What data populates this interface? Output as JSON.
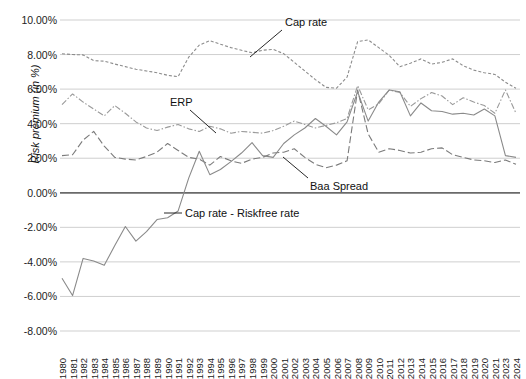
{
  "chart_data": {
    "type": "line",
    "title": "",
    "xlabel": "",
    "ylabel": "Risk premium (in %)",
    "ylim": [
      -8,
      10
    ],
    "ytick_labels": [
      "10.00%",
      "8.00%",
      "6.00%",
      "4.00%",
      "2.00%",
      "0.00%",
      "-2.00%",
      "-4.00%",
      "-6.00%",
      "-8.00%"
    ],
    "ytick_values": [
      10,
      8,
      6,
      4,
      2,
      0,
      -2,
      -4,
      -6,
      -8
    ],
    "grid": true,
    "zero_line": true,
    "legend_position": "inline-annotations",
    "categories": [
      "1980",
      "1981",
      "1982",
      "1983",
      "1984",
      "1985",
      "1986",
      "1987",
      "1988",
      "1989",
      "1990",
      "1991",
      "1992",
      "1993",
      "1994",
      "1995",
      "1996",
      "1997",
      "1998",
      "1999",
      "2000",
      "2001",
      "2002",
      "2003",
      "2004",
      "2005",
      "2006",
      "2007",
      "2008",
      "2009",
      "2010",
      "2011",
      "2012",
      "2013",
      "2014",
      "2015",
      "2016",
      "2017",
      "2018",
      "2019",
      "2020",
      "2021",
      "2023",
      "2024"
    ],
    "series": [
      {
        "name": "Cap rate",
        "style": "short-dash",
        "color": "#8c8c8c",
        "values": [
          8.05,
          8.0,
          7.98,
          7.65,
          7.62,
          7.45,
          7.3,
          7.15,
          7.05,
          6.95,
          6.8,
          6.72,
          7.85,
          8.55,
          8.8,
          8.6,
          8.4,
          8.25,
          8.1,
          8.25,
          8.3,
          8.05,
          7.55,
          7.05,
          6.55,
          6.1,
          6.05,
          6.7,
          8.75,
          8.85,
          8.4,
          7.95,
          7.3,
          7.5,
          7.75,
          7.45,
          7.55,
          7.75,
          7.35,
          7.1,
          6.95,
          6.85,
          6.4,
          6.05
        ]
      },
      {
        "name": "ERP",
        "style": "dash-dot",
        "color": "#9a9a9a",
        "values": [
          5.1,
          5.72,
          5.25,
          4.85,
          4.45,
          5.05,
          4.6,
          4.1,
          3.75,
          3.6,
          3.8,
          3.95,
          3.7,
          3.55,
          3.85,
          3.7,
          3.45,
          3.55,
          3.5,
          3.45,
          3.6,
          3.85,
          4.15,
          3.95,
          3.75,
          3.9,
          4.05,
          4.3,
          6.2,
          4.8,
          5.15,
          5.95,
          5.8,
          5.0,
          5.45,
          5.8,
          5.6,
          5.1,
          5.5,
          5.25,
          5.05,
          4.6,
          5.95,
          4.6
        ]
      },
      {
        "name": "Baa Spread",
        "style": "long-dash",
        "color": "#7b7b7b",
        "values": [
          2.15,
          2.2,
          3.05,
          3.55,
          2.7,
          2.05,
          1.95,
          1.9,
          2.1,
          2.35,
          2.85,
          2.45,
          2.05,
          1.95,
          1.6,
          2.1,
          1.85,
          1.7,
          1.95,
          2.05,
          2.3,
          2.35,
          2.55,
          2.05,
          1.65,
          1.45,
          1.6,
          1.85,
          5.95,
          3.4,
          2.35,
          2.55,
          2.45,
          2.3,
          2.35,
          2.55,
          2.6,
          2.2,
          2.05,
          1.9,
          1.85,
          1.75,
          1.9,
          1.65
        ]
      },
      {
        "name": "Cap rate - Riskfree rate",
        "style": "solid",
        "color": "#8a8a8a",
        "values": [
          -4.95,
          -5.95,
          -3.8,
          -3.95,
          -4.2,
          -3.05,
          -1.95,
          -2.8,
          -2.25,
          -1.55,
          -1.45,
          -1.05,
          0.85,
          2.4,
          1.05,
          1.35,
          1.8,
          2.3,
          2.9,
          2.15,
          2.05,
          2.85,
          3.35,
          3.75,
          4.3,
          3.85,
          3.35,
          4.1,
          5.85,
          4.15,
          5.25,
          5.95,
          5.85,
          4.45,
          5.2,
          4.75,
          4.7,
          4.55,
          4.6,
          4.5,
          4.85,
          4.45,
          2.15,
          2.05
        ]
      }
    ],
    "annotations": [
      {
        "label": "Cap rate",
        "x": 285,
        "y": 16,
        "leader": {
          "x1": 282,
          "y1": 30,
          "x2": 250,
          "y2": 57
        }
      },
      {
        "label": "ERP",
        "x": 170,
        "y": 96,
        "leader": {
          "x1": 190,
          "y1": 110,
          "x2": 216,
          "y2": 133
        }
      },
      {
        "label": "Baa Spread",
        "x": 310,
        "y": 180,
        "leader": {
          "x1": 308,
          "y1": 178,
          "x2": 283,
          "y2": 157
        }
      },
      {
        "label": "Cap rate - Riskfree rate",
        "x": 185,
        "y": 207,
        "leader": {
          "x1": 182,
          "y1": 213,
          "x2": 164,
          "y2": 213
        }
      }
    ]
  }
}
